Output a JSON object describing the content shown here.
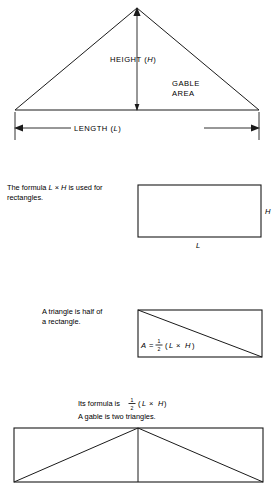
{
  "figure1": {
    "name": "gable-triangle-diagram",
    "height_label": "HEIGHT (",
    "height_label_var": "H",
    "height_label_close": ")",
    "area_label_line1": "GABLE",
    "area_label_line2": "AREA",
    "length_label": "LENGTH (",
    "length_label_var": "L",
    "length_label_close": ")"
  },
  "figure2": {
    "name": "rectangle-formula",
    "caption_line1_part1": "The formula ",
    "caption_line1_var1": "L",
    "caption_line1_part2": " × ",
    "caption_line1_var2": "H",
    "caption_line1_part3": " is used for",
    "caption_line2": "rectangles.",
    "side_label_h": "H",
    "side_label_l": "L"
  },
  "figure3": {
    "name": "triangle-half-rectangle",
    "caption_line1": "A triangle is half of",
    "caption_line2": "a rectangle.",
    "formula_a": "A",
    "formula_eq": "=",
    "formula_num": "1",
    "formula_den": "2",
    "formula_open": "(",
    "formula_l": "L",
    "formula_times": "×",
    "formula_h": "H",
    "formula_close": ")"
  },
  "figure4": {
    "name": "gable-two-triangles",
    "caption_line1_prefix": "Its formula is ",
    "caption_line1_num": "1",
    "caption_line1_den": "2",
    "caption_line1_open": "(",
    "caption_line1_l": "L",
    "caption_line1_times": "×",
    "caption_line1_h": "H",
    "caption_line1_close": ")",
    "caption_line2": "A gable is two triangles."
  },
  "colors": {
    "ink": "#1a1a1a",
    "paper": "#ffffff"
  }
}
